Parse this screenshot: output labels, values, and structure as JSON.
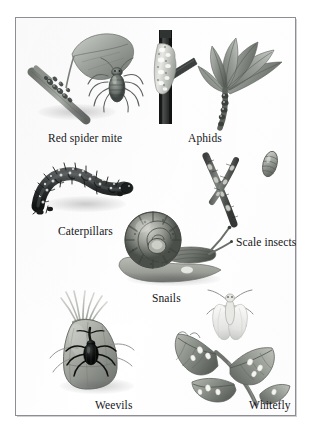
{
  "plate": {
    "kind": "illustration-plate",
    "background_color": "#ffffff",
    "frame_color": "#8d8d93",
    "palette": {
      "ink_dark": "#15161a",
      "foliage_mid": "#8f9490",
      "foliage_dark": "#5b615d",
      "foliage_light": "#c3c7c2",
      "stem_dark": "#3a3c3b",
      "highlight": "#f2f2ef"
    }
  },
  "specimens": [
    {
      "id": "red-spider-mite",
      "caption": "Red spider mite",
      "description": "Leafy shoot with mites clustered on the stem beside an enlarged mite",
      "caption_position": {
        "left": 32,
        "top": 114
      }
    },
    {
      "id": "aphids",
      "caption": "Aphids",
      "description": "Dark woody stem encrusted with a pale colony of aphids",
      "caption_position": {
        "left": 172,
        "top": 114
      }
    },
    {
      "id": "caterpillars",
      "caption": "Caterpillars",
      "description": "Bristly looping caterpillar arched on a surface",
      "caption_position": {
        "left": 42,
        "top": 207
      }
    },
    {
      "id": "scale-insects",
      "caption": "Scale insects",
      "description": "Forked twig studded with scales next to an enlarged scale",
      "caption_position": {
        "left": 220,
        "top": 218
      }
    },
    {
      "id": "snails",
      "caption": "Snails",
      "description": "Garden snail with banded coiled shell extended on its foot",
      "caption_position": {
        "left": 136,
        "top": 274
      }
    },
    {
      "id": "weevils",
      "caption": "Weevils",
      "description": "Dark weevil on a pale tuberous bud or sheath",
      "caption_position": {
        "left": 79,
        "top": 381
      }
    },
    {
      "id": "whitefly",
      "caption": "Whitefly",
      "description": "Toothed leaf spray spotted with whitefly beside an enlarged adult",
      "caption_position": {
        "left": 233,
        "top": 381
      }
    }
  ]
}
